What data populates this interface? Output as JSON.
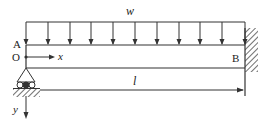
{
  "diagram": {
    "type": "beam-structural-diagram",
    "labels": {
      "load": "w",
      "end_left": "A",
      "end_right": "B",
      "origin": "O",
      "x_axis": "x",
      "y_axis": "y",
      "span": "l"
    },
    "load": {
      "kind": "uniformly distributed",
      "arrow_count": 12
    },
    "supports": {
      "left": "roller support (triangle on rollers over hatched ground)",
      "right": "fixed wall (hatched)"
    },
    "colors": {
      "line": "#333333",
      "text": "#222222",
      "background": "#ffffff"
    }
  }
}
